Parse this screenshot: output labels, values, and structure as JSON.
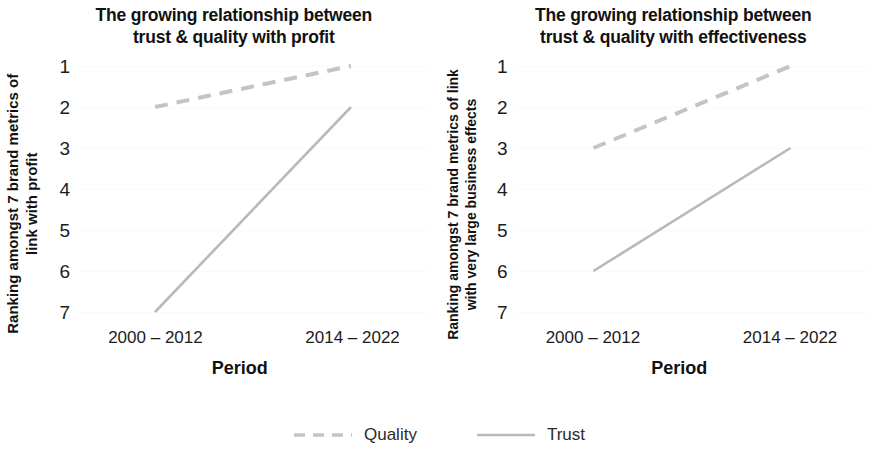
{
  "chart_data": [
    {
      "type": "line",
      "panel": "left",
      "title": "The growing relationship between trust & quality with profit",
      "title_lines": [
        "The growing relationship between",
        "trust & quality with profit"
      ],
      "xlabel": "Period",
      "ylabel": "Ranking amongst 7 brand metrics of link with profit",
      "ylabel_lines": [
        "Ranking amongst 7 brand metrics of",
        "link with profit"
      ],
      "categories": [
        "2000 – 2012",
        "2014 – 2022"
      ],
      "yticks": [
        1,
        2,
        3,
        4,
        5,
        6,
        7
      ],
      "ylim": [
        1,
        7
      ],
      "y_inverted": true,
      "grid": true,
      "series": [
        {
          "name": "Quality",
          "values": [
            2,
            1
          ],
          "style": "dashed",
          "color": "#c4c4c4"
        },
        {
          "name": "Trust",
          "values": [
            7,
            2
          ],
          "style": "solid",
          "color": "#b9b9b9"
        }
      ]
    },
    {
      "type": "line",
      "panel": "right",
      "title": "The growing relationship between trust & quality with effectiveness",
      "title_lines": [
        "The growing relationship between",
        "trust & quality with effectiveness"
      ],
      "xlabel": "Period",
      "ylabel": "Ranking amongst 7 brand metrics of link with very large business effects",
      "ylabel_lines": [
        "Ranking amongst 7 brand metrics of link",
        "with very large business effects"
      ],
      "categories": [
        "2000 – 2012",
        "2014 – 2022"
      ],
      "yticks": [
        1,
        2,
        3,
        4,
        5,
        6,
        7
      ],
      "ylim": [
        1,
        7
      ],
      "y_inverted": true,
      "grid": true,
      "series": [
        {
          "name": "Quality",
          "values": [
            3,
            1
          ],
          "style": "dashed",
          "color": "#c4c4c4"
        },
        {
          "name": "Trust",
          "values": [
            6,
            3
          ],
          "style": "solid",
          "color": "#b9b9b9"
        }
      ]
    }
  ],
  "legend": {
    "position": "bottom-center",
    "items": [
      {
        "label": "Quality",
        "style": "dashed",
        "color": "#c4c4c4"
      },
      {
        "label": "Trust",
        "style": "solid",
        "color": "#b9b9b9"
      }
    ]
  },
  "left": {
    "title_line1": "The growing relationship between",
    "title_line2": "trust & quality with profit",
    "ylabel_line1": "Ranking amongst 7 brand metrics of",
    "ylabel_line2": "link with profit",
    "xlabel": "Period",
    "xtick1": "2000 – 2012",
    "xtick2": "2014 – 2022"
  },
  "right": {
    "title_line1": "The growing relationship between",
    "title_line2": "trust & quality with effectiveness",
    "ylabel_line1": "Ranking amongst 7 brand metrics of link",
    "ylabel_line2": "with very large business effects",
    "xlabel": "Period",
    "xtick1": "2000 – 2012",
    "xtick2": "2014 – 2022"
  }
}
